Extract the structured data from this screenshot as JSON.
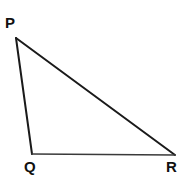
{
  "diagram": {
    "name": "triangle-pqr",
    "type": "triangle",
    "canvas": {
      "width": 185,
      "height": 179,
      "background": "#ffffff"
    },
    "stroke": {
      "color": "#1a1a1a",
      "width": 2,
      "light_color": "#3a3a3a",
      "light_width": 1.6
    },
    "vertices": [
      {
        "id": "P",
        "label": "P",
        "x": 16,
        "y": 38,
        "label_x": 5,
        "label_y": 15
      },
      {
        "id": "Q",
        "label": "Q",
        "x": 32,
        "y": 154,
        "label_x": 24,
        "label_y": 159
      },
      {
        "id": "R",
        "label": "R",
        "x": 175,
        "y": 155,
        "label_x": 166,
        "label_y": 159
      }
    ],
    "edges": [
      {
        "id": "PQ",
        "from": "P",
        "to": "Q",
        "points": "16,38 32,154"
      },
      {
        "id": "PR",
        "from": "P",
        "to": "R",
        "points": "16,38 175,155"
      },
      {
        "id": "QR",
        "from": "Q",
        "to": "R",
        "points": "32,154 175,155"
      }
    ],
    "polygon_points": "16,38 175,155 32,154"
  }
}
